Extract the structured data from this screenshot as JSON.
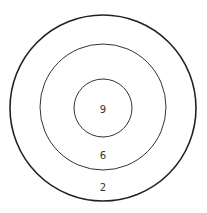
{
  "diagram": {
    "type": "concentric-target",
    "rings": [
      {
        "name": "outer",
        "label": "2",
        "radius": 93
      },
      {
        "name": "middle",
        "label": "6",
        "radius": 63
      },
      {
        "name": "inner",
        "label": "9",
        "radius": 29
      }
    ]
  }
}
